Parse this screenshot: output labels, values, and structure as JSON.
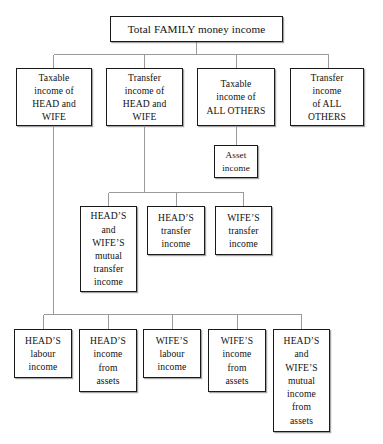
{
  "diagram": {
    "background_color": "#ffffff",
    "box_border_color": "#1a1a1a",
    "connector_color": "#9a9a9a",
    "levels": 4,
    "nodes": [
      {
        "id": "total-family-money-income",
        "label": "Total FAMILY money income",
        "level": 0
      },
      {
        "id": "taxable-income-head-wife",
        "label": "Taxable\nincome of\nHEAD and\nWIFE",
        "level": 1
      },
      {
        "id": "transfer-income-head-wife",
        "label": "Transfer\nincome of\nHEAD and\nWIFE",
        "level": 1
      },
      {
        "id": "taxable-income-all-others",
        "label": "Taxable\nincome of\nALL OTHERS",
        "level": 1
      },
      {
        "id": "transfer-income-all-others",
        "label": "Transfer\nincome\nof ALL\nOTHERS",
        "level": 1
      },
      {
        "id": "asset-income",
        "label": "Asset\nincome",
        "level": 2
      },
      {
        "id": "head-wife-mutual-transfer-income",
        "label": "HEAD’S\nand\nWIFE’S\nmutual\ntransfer\nincome",
        "level": 2
      },
      {
        "id": "head-transfer-income",
        "label": "HEAD’S\ntransfer\nincome",
        "level": 2
      },
      {
        "id": "wife-transfer-income",
        "label": "WIFE’S\ntransfer\nincome",
        "level": 2
      },
      {
        "id": "head-labour-income",
        "label": "HEAD’S\nlabour\nincome",
        "level": 3
      },
      {
        "id": "head-income-from-assets",
        "label": "HEAD’S\nincome\nfrom\nassets",
        "level": 3
      },
      {
        "id": "wife-labour-income",
        "label": "WIFE’S\nlabour\nincome",
        "level": 3
      },
      {
        "id": "wife-income-from-assets",
        "label": "WIFE’S\nincome\nfrom\nassets",
        "level": 3
      },
      {
        "id": "head-wife-mutual-income-from-assets",
        "label": "HEAD’S\nand\nWIFE’S\nmutual\nincome\nfrom\nassets",
        "level": 3
      }
    ],
    "edges": [
      {
        "from": "total-family-money-income",
        "to": "taxable-income-head-wife"
      },
      {
        "from": "total-family-money-income",
        "to": "transfer-income-head-wife"
      },
      {
        "from": "total-family-money-income",
        "to": "taxable-income-all-others"
      },
      {
        "from": "total-family-money-income",
        "to": "transfer-income-all-others"
      },
      {
        "from": "taxable-income-all-others",
        "to": "asset-income"
      },
      {
        "from": "transfer-income-head-wife",
        "to": "head-wife-mutual-transfer-income"
      },
      {
        "from": "transfer-income-head-wife",
        "to": "head-transfer-income"
      },
      {
        "from": "transfer-income-head-wife",
        "to": "wife-transfer-income"
      },
      {
        "from": "taxable-income-head-wife",
        "to": "head-labour-income"
      },
      {
        "from": "taxable-income-head-wife",
        "to": "head-income-from-assets"
      },
      {
        "from": "taxable-income-head-wife",
        "to": "wife-labour-income"
      },
      {
        "from": "taxable-income-head-wife",
        "to": "wife-income-from-assets"
      },
      {
        "from": "taxable-income-head-wife",
        "to": "head-wife-mutual-income-from-assets"
      }
    ]
  }
}
